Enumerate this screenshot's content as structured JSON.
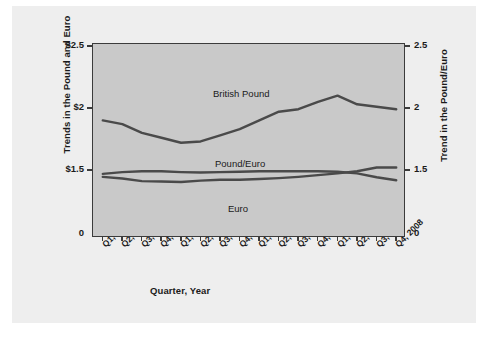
{
  "chart_data": {
    "type": "line",
    "title": "",
    "xlabel": "Quarter, Year",
    "ylabel": "Trends in the Pound and Euro",
    "ylabel_right": "Trend in the Pound/Euro",
    "categories": [
      "Q1, 2005",
      "Q2, 2005",
      "Q3, 2005",
      "Q4, 2005",
      "Q1, 2006",
      "Q2, 2006",
      "Q3, 2006",
      "Q4, 2006",
      "Q1, 2007",
      "Q2, 2007",
      "Q3, 2007",
      "Q4, 2007",
      "Q1, 2008",
      "Q2, 2008",
      "Q3, 2008",
      "Q4, 2008"
    ],
    "ytick_labels_left": [
      "$2.5",
      "$2",
      "$1.5",
      "0"
    ],
    "ytick_values_left": [
      2.5,
      2.0,
      1.5,
      0
    ],
    "ytick_labels_right": [
      "2.5",
      "2",
      "1.5",
      "0"
    ],
    "ytick_values_right": [
      2.5,
      2.0,
      1.5,
      0
    ],
    "ylim": [
      0,
      2.5
    ],
    "axis_break": true,
    "grid": false,
    "legend": "inline-annotations",
    "series": [
      {
        "name": "British Pound",
        "label_position": "above-right",
        "values": [
          1.9,
          1.87,
          1.8,
          1.76,
          1.72,
          1.73,
          1.78,
          1.83,
          1.9,
          1.97,
          1.99,
          2.05,
          2.1,
          2.03,
          2.01,
          1.99
        ]
      },
      {
        "name": "Pound/Euro",
        "label_position": "above-center",
        "values": [
          1.41,
          1.45,
          1.47,
          1.47,
          1.45,
          1.44,
          1.45,
          1.46,
          1.47,
          1.47,
          1.47,
          1.47,
          1.46,
          1.42,
          1.33,
          1.26
        ]
      },
      {
        "name": "Euro",
        "label_position": "below-center",
        "values": [
          1.34,
          1.3,
          1.24,
          1.23,
          1.22,
          1.25,
          1.27,
          1.27,
          1.29,
          1.31,
          1.34,
          1.38,
          1.42,
          1.47,
          1.52,
          1.52
        ]
      }
    ],
    "colors": {
      "line": "#4a4a4a",
      "plot_background": "#c9c9c9",
      "panel_background": "#eeeeee",
      "axis": "#3b3b3b",
      "text": "#1a1a1a"
    }
  }
}
